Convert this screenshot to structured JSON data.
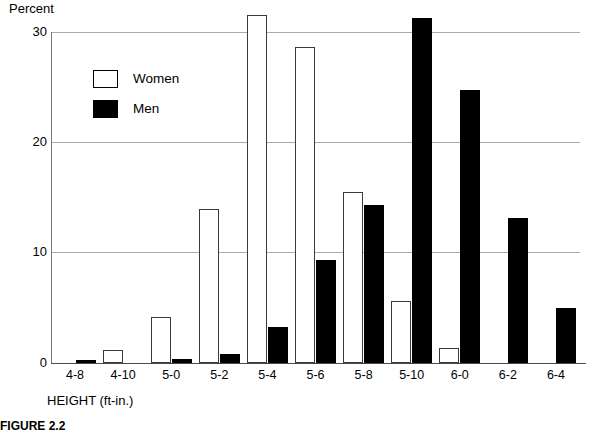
{
  "chart_data": {
    "type": "bar",
    "title": "",
    "subtitle": "",
    "xlabel": "HEIGHT (ft-in.)",
    "ylabel": "Percent",
    "categories": [
      "4-8",
      "4-10",
      "5-0",
      "5-2",
      "5-4",
      "5-6",
      "5-8",
      "5-10",
      "6-0",
      "6-2",
      "6-4"
    ],
    "series": [
      {
        "name": "Women",
        "color": "#ffffff",
        "values": [
          0.0,
          1.2,
          4.2,
          14.0,
          31.5,
          28.6,
          15.5,
          5.6,
          1.4,
          0.0,
          0.0
        ]
      },
      {
        "name": "Men",
        "color": "#000000",
        "values": [
          0.3,
          0.0,
          0.4,
          0.8,
          3.3,
          9.3,
          14.3,
          31.3,
          24.7,
          13.1,
          5.0
        ]
      }
    ],
    "ylim": [
      0,
      31.5
    ],
    "yticks": [
      0,
      10,
      20,
      30
    ],
    "ytick_labels": [
      "0",
      "10",
      "20",
      "30"
    ],
    "grid": true,
    "grid_axis": "y",
    "legend_position": "upper-left-inside",
    "axis_range_note": "Top axis frame drawn at 30; tallest bar (Women 5-4) exceeds it"
  },
  "axes": {
    "y_title": "Percent",
    "x_title": "HEIGHT (ft-in.)"
  },
  "legend": {
    "items": [
      {
        "label": "Women",
        "swatch": "open-square-swatch"
      },
      {
        "label": "Men",
        "swatch": "filled-square-swatch"
      }
    ]
  },
  "caption": {
    "text": "FIGURE 2.2"
  }
}
